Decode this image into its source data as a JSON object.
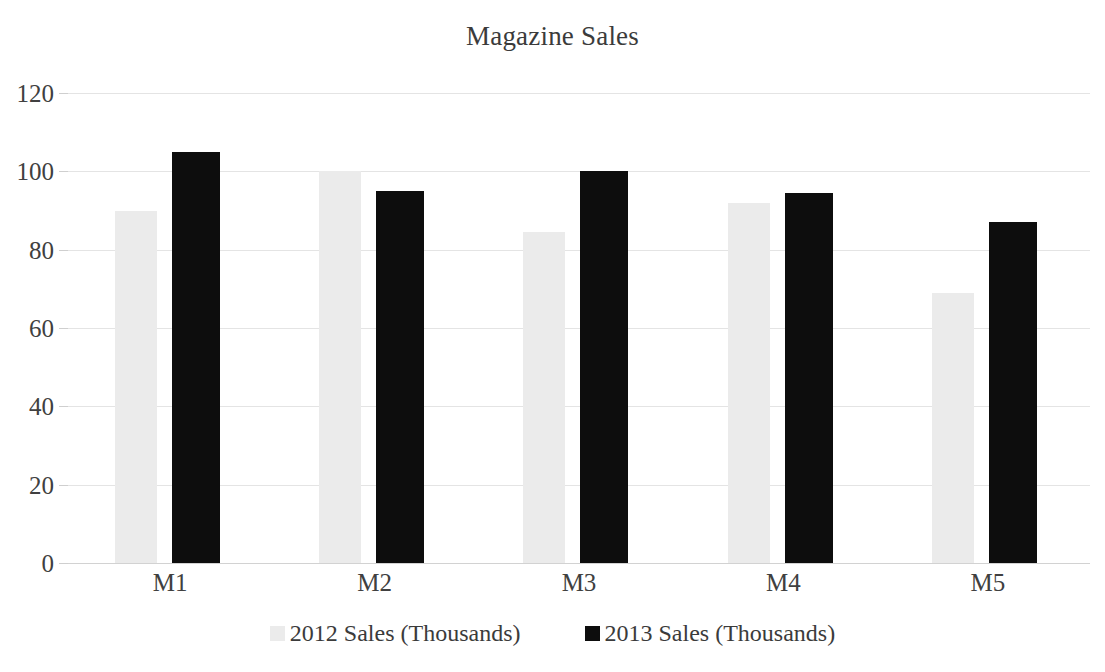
{
  "chart_data": {
    "type": "bar",
    "title": "Magazine Sales",
    "xlabel": "",
    "ylabel": "",
    "categories": [
      "M1",
      "M2",
      "M3",
      "M4",
      "M5"
    ],
    "series": [
      {
        "name": "2012 Sales (Thousands)",
        "color": "#ebebeb",
        "values": [
          90,
          100,
          84.5,
          92,
          69
        ]
      },
      {
        "name": "2013 Sales (Thousands)",
        "color": "#0d0d0d",
        "values": [
          105,
          95,
          100,
          94.5,
          87
        ]
      }
    ],
    "ylim": [
      0,
      120
    ],
    "ytick_values": [
      0,
      20,
      40,
      60,
      80,
      100,
      120
    ],
    "ytick_labels": [
      "0",
      "20",
      "40",
      "60",
      "80",
      "100",
      "120"
    ],
    "grid": true,
    "grid_color": "#e4e4e4",
    "legend_position": "bottom",
    "background": "#ffffff"
  }
}
